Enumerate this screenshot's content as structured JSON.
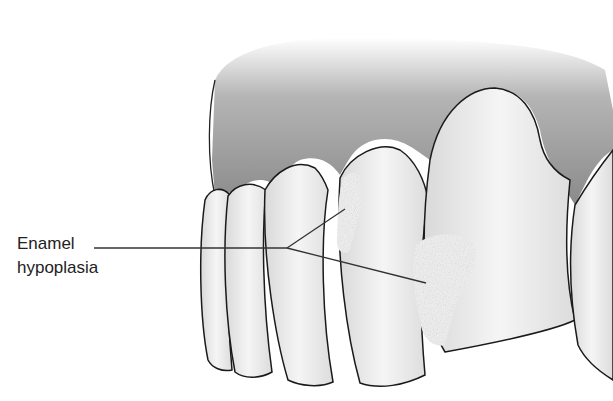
{
  "figure": {
    "label_line1": "Enamel",
    "label_line2": "hypoplasia",
    "colors": {
      "gum": "#8f8f8f",
      "tooth": "#ededed",
      "lesion": "#f7f7f7",
      "outline": "#1a1a1a",
      "text": "#222222"
    }
  }
}
